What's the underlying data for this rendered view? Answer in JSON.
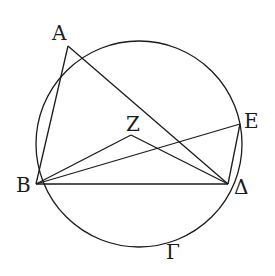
{
  "diagram": {
    "type": "geometry",
    "circle": {
      "name": "Γ",
      "cx": 139,
      "cy": 144,
      "r": 103
    },
    "points": {
      "A": {
        "x": 68,
        "y": 46
      },
      "B": {
        "x": 36,
        "y": 184
      },
      "Delta": {
        "x": 228,
        "y": 184
      },
      "E": {
        "x": 240,
        "y": 124
      },
      "Z": {
        "x": 131,
        "y": 135
      }
    },
    "segments": [
      [
        "A",
        "B"
      ],
      [
        "A",
        "Delta"
      ],
      [
        "B",
        "Z"
      ],
      [
        "Z",
        "Delta"
      ],
      [
        "B",
        "E"
      ],
      [
        "B",
        "Delta"
      ],
      [
        "E",
        "Delta"
      ]
    ],
    "labels": {
      "A": "A",
      "B": "B",
      "Delta": "Δ",
      "E": "E",
      "Z": "Z",
      "Gamma": "Γ"
    },
    "stroke_color": "#1a1a1a"
  }
}
